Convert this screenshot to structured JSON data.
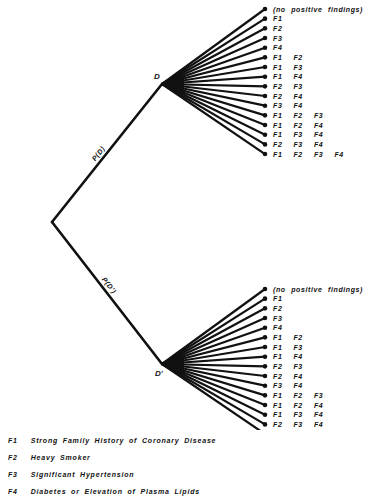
{
  "diagram": {
    "type": "probability-tree",
    "root": {
      "x": 52,
      "y": 222
    },
    "branches": [
      {
        "node_label": "D",
        "edge_label": "P(D)",
        "node": {
          "x": 162,
          "y": 84
        },
        "leaf_x": 265,
        "leaf_y_start": 9,
        "leaf_y_step": 9.67,
        "leaves": [
          "(no positive findings)",
          "F1",
          "F2",
          "F3",
          "F4",
          "F1  F2",
          "F1  F3",
          "F1  F4",
          "F2  F3",
          "F2  F4",
          "F3  F4",
          "F1  F2  F3",
          "F1  F2  F4",
          "F1  F3  F4",
          "F2  F3  F4",
          "F1  F2  F3  F4"
        ]
      },
      {
        "node_label": "D'",
        "edge_label": "P(D')",
        "node": {
          "x": 162,
          "y": 364
        },
        "leaf_x": 265,
        "leaf_y_start": 289,
        "leaf_y_step": 9.67,
        "leaves": [
          "(no positive findings)",
          "F1",
          "F2",
          "F3",
          "F4",
          "F1  F2",
          "F1  F3",
          "F1  F4",
          "F2  F3",
          "F2  F4",
          "F3  F4",
          "F1  F2  F3",
          "F1  F2  F4",
          "F1  F3  F4",
          "F2  F3  F4",
          "F1  F2  F3  F4"
        ]
      }
    ]
  },
  "legend": [
    {
      "code": "F1",
      "text": "Strong Family History of Coronary Disease"
    },
    {
      "code": "F2",
      "text": "Heavy Smoker"
    },
    {
      "code": "F3",
      "text": "Significant Hypertension"
    },
    {
      "code": "F4",
      "text": "Diabetes or Elevation of Plasma Lipids"
    }
  ],
  "colors": {
    "ink": "#111111",
    "background": "#ffffff"
  }
}
